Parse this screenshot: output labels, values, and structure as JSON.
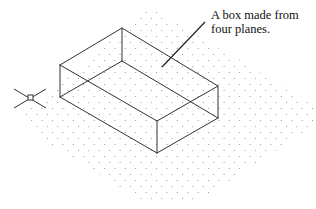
{
  "figure": {
    "annotation": {
      "line1": "A box made from",
      "line2": "four planes."
    },
    "ucs_icon": {
      "label": "S"
    },
    "colors": {
      "lines": "#333333",
      "grid_dots": "#9a9a9a",
      "background": "#ffffff"
    }
  }
}
